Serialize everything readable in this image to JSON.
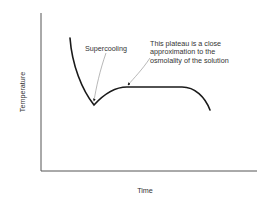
{
  "diagram": {
    "type": "cooling-curve",
    "axes": {
      "x_label": "Time",
      "y_label": "Temperature"
    },
    "annotations": {
      "supercooling": "Supercooling",
      "plateau_lines": [
        "This plateau is a close",
        "approximation to the",
        "osmolality of the solution"
      ]
    },
    "colors": {
      "axis": "#555555",
      "curve": "#1a1a1a",
      "pointer": "#888888",
      "text": "#333333"
    }
  }
}
